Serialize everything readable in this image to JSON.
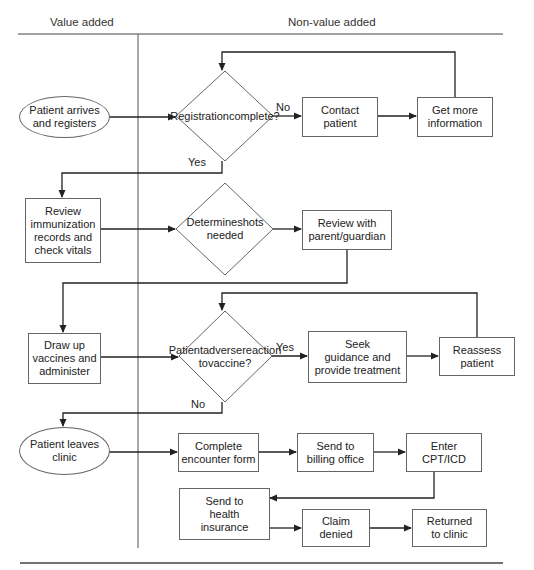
{
  "lanes": {
    "value_added": "Value added",
    "non_value_added": "Non-value added"
  },
  "nodes": {
    "patient_arrives": "Patient arrives and registers",
    "registration_complete": "Registration complete?",
    "contact_patient": "Contact patient",
    "get_more_info": "Get more information",
    "review_immunization": "Review immunization records and check vitals",
    "determine_shots": "Determine shots needed",
    "review_parent": "Review with parent/guardian",
    "draw_up_vaccines": "Draw up vaccines and administer",
    "adverse_reaction": "Patient adverse reaction to vaccine?",
    "seek_guidance": "Seek guidance and provide treatment",
    "reassess_patient": "Reassess patient",
    "patient_leaves": "Patient leaves clinic",
    "complete_encounter": "Complete encounter form",
    "send_billing": "Send to billing office",
    "enter_cpt": "Enter CPT/ICD",
    "send_insurance": "Send to health insurance",
    "claim_denied": "Claim denied",
    "returned_clinic": "Returned to clinic"
  },
  "node_lines": {
    "patient_arrives": [
      "Patient arrives",
      "and registers"
    ],
    "registration_complete": [
      "Registration",
      "complete?"
    ],
    "contact_patient": [
      "Contact",
      "patient"
    ],
    "get_more_info": [
      "Get more",
      "information"
    ],
    "review_immunization": [
      "Review",
      "immunization",
      "records and",
      "check vitals"
    ],
    "determine_shots": [
      "Determine",
      "shots needed"
    ],
    "review_parent": [
      "Review with",
      "parent/guardian"
    ],
    "draw_up_vaccines": [
      "Draw up",
      "vaccines and",
      "administer"
    ],
    "adverse_reaction": [
      "Patient",
      "adverse",
      "reaction to",
      "vaccine?"
    ],
    "seek_guidance": [
      "Seek",
      "guidance and",
      "provide treatment"
    ],
    "reassess_patient": [
      "Reassess",
      "patient"
    ],
    "patient_leaves": [
      "Patient leaves",
      "clinic"
    ],
    "complete_encounter": [
      "Complete",
      "encounter form"
    ],
    "send_billing": [
      "Send to",
      "billing office"
    ],
    "enter_cpt": [
      "Enter",
      "CPT/ICD"
    ],
    "send_insurance": [
      "Send to",
      "health",
      "insurance"
    ],
    "claim_denied": [
      "Claim",
      "denied"
    ],
    "returned_clinic": [
      "Returned",
      "to clinic"
    ]
  },
  "edge_labels": {
    "reg_no": "No",
    "reg_yes": "Yes",
    "adverse_yes": "Yes",
    "adverse_no": "No"
  },
  "colors": {
    "line": "#222222",
    "border": "#666666",
    "text": "#222222"
  }
}
